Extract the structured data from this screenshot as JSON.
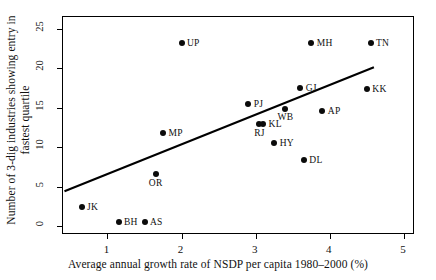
{
  "chart_data": {
    "type": "scatter",
    "title": "",
    "xlabel": "Average annual growth rate of NSDP per capita 1980–2000 (%)",
    "ylabel": "Number of 3-dig industries showing entry in fastest quartile",
    "ylabel_line1": "Number of 3-dig industries showing entry in",
    "ylabel_line2": "fastest quartile",
    "xlim": [
      0.4,
      5.15
    ],
    "ylim": [
      -1.1,
      26.5
    ],
    "xticks": [
      1,
      2,
      3,
      4,
      5
    ],
    "yticks": [
      0,
      5,
      10,
      15,
      20,
      25
    ],
    "xtick_labels": [
      "1",
      "2",
      "3",
      "4",
      "5"
    ],
    "ytick_labels": [
      "0",
      "5",
      "10",
      "15",
      "20",
      "25"
    ],
    "grid": false,
    "legend": "none",
    "marker_color": "#0b0b0b",
    "line_color": "#000000",
    "points": [
      {
        "label": "JK",
        "x": 0.65,
        "y": 2.5,
        "label_pos": "right"
      },
      {
        "label": "BH",
        "x": 1.15,
        "y": 0.6,
        "label_pos": "right"
      },
      {
        "label": "AS",
        "x": 1.5,
        "y": 0.6,
        "label_pos": "right"
      },
      {
        "label": "OR",
        "x": 1.65,
        "y": 6.6,
        "label_pos": "below"
      },
      {
        "label": "MP",
        "x": 1.75,
        "y": 11.8,
        "label_pos": "right"
      },
      {
        "label": "UP",
        "x": 2.0,
        "y": 23.2,
        "label_pos": "right"
      },
      {
        "label": "PJ",
        "x": 2.9,
        "y": 15.5,
        "label_pos": "right"
      },
      {
        "label": "RJ",
        "x": 3.05,
        "y": 12.9,
        "label_pos": "below"
      },
      {
        "label": "KL",
        "x": 3.1,
        "y": 13.0,
        "label_pos": "right"
      },
      {
        "label": "HY",
        "x": 3.25,
        "y": 10.6,
        "label_pos": "right"
      },
      {
        "label": "WB",
        "x": 3.4,
        "y": 14.9,
        "label_pos": "below"
      },
      {
        "label": "GJ",
        "x": 3.6,
        "y": 17.5,
        "label_pos": "right"
      },
      {
        "label": "DL",
        "x": 3.65,
        "y": 8.4,
        "label_pos": "right"
      },
      {
        "label": "MH",
        "x": 3.75,
        "y": 23.2,
        "label_pos": "right"
      },
      {
        "label": "AP",
        "x": 3.9,
        "y": 14.6,
        "label_pos": "right"
      },
      {
        "label": "KK",
        "x": 4.5,
        "y": 17.4,
        "label_pos": "right"
      },
      {
        "label": "TN",
        "x": 4.55,
        "y": 23.2,
        "label_pos": "right"
      }
    ],
    "fit_line": {
      "type": "linear-fit",
      "x_start": 0.42,
      "y_start": 4.3,
      "x_end": 4.62,
      "y_end": 20.1
    }
  }
}
